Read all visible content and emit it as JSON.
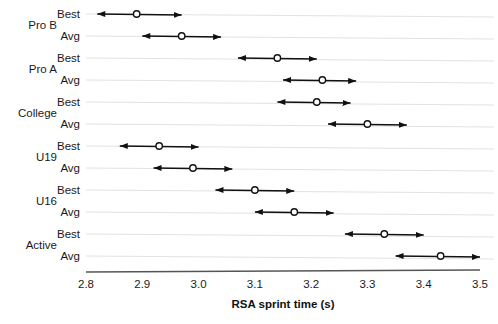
{
  "chart_data": {
    "type": "scatter",
    "title": "",
    "xlabel": "RSA sprint time (s)",
    "ylabel": "",
    "xlim": [
      2.8,
      3.5
    ],
    "xticks": [
      "2.8",
      "2.9",
      "3.0",
      "3.1",
      "3.2",
      "3.3",
      "3.4",
      "3.5"
    ],
    "xtick_values": [
      2.8,
      2.9,
      3.0,
      3.1,
      3.2,
      3.3,
      3.4,
      3.5
    ],
    "grid": "horizontal",
    "legend": "none",
    "marker_style": "open-circle",
    "interval_style": "double-headed-arrow",
    "groups": [
      "Pro B",
      "Pro A",
      "College",
      "U19",
      "U16",
      "Active"
    ],
    "measures": [
      "Best",
      "Avg"
    ],
    "series": [
      {
        "group": "Pro B",
        "measure": "Best",
        "value": 2.89,
        "low": 2.82,
        "high": 2.97
      },
      {
        "group": "Pro B",
        "measure": "Avg",
        "value": 2.97,
        "low": 2.9,
        "high": 3.04
      },
      {
        "group": "Pro A",
        "measure": "Best",
        "value": 3.14,
        "low": 3.07,
        "high": 3.21
      },
      {
        "group": "Pro A",
        "measure": "Avg",
        "value": 3.22,
        "low": 3.15,
        "high": 3.28
      },
      {
        "group": "College",
        "measure": "Best",
        "value": 3.21,
        "low": 3.14,
        "high": 3.27
      },
      {
        "group": "College",
        "measure": "Avg",
        "value": 3.3,
        "low": 3.23,
        "high": 3.37
      },
      {
        "group": "U19",
        "measure": "Best",
        "value": 2.93,
        "low": 2.86,
        "high": 3.0
      },
      {
        "group": "U19",
        "measure": "Avg",
        "value": 2.99,
        "low": 2.92,
        "high": 3.06
      },
      {
        "group": "U16",
        "measure": "Best",
        "value": 3.1,
        "low": 3.03,
        "high": 3.17
      },
      {
        "group": "U16",
        "measure": "Avg",
        "value": 3.17,
        "low": 3.1,
        "high": 3.24
      },
      {
        "group": "Active",
        "measure": "Best",
        "value": 3.33,
        "low": 3.26,
        "high": 3.4
      },
      {
        "group": "Active",
        "measure": "Avg",
        "value": 3.43,
        "low": 3.35,
        "high": 3.5
      }
    ]
  },
  "colors": {
    "arrow": "#111111",
    "marker_fill": "#ffffff",
    "marker_stroke": "#111111",
    "gridline": "#e2e2e2",
    "axis": "#555555",
    "text": "#1a1a1a"
  }
}
